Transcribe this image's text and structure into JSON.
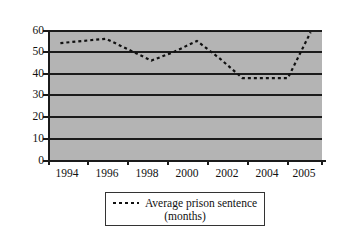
{
  "chart_data": {
    "type": "line",
    "title": "",
    "subtitle": "",
    "xlabel": "",
    "ylabel": "",
    "x": [
      1994,
      1995,
      1996,
      1997,
      1998,
      1999,
      2000,
      2001,
      2002,
      2003,
      2004,
      2005
    ],
    "categories": [
      "1994",
      "1995",
      "1996",
      "1997",
      "1998",
      "1999",
      "2000",
      "2001",
      "2002",
      "2003",
      "2004",
      "2005"
    ],
    "xtick_labels": [
      "1994",
      "1996",
      "1998",
      "2000",
      "2002",
      "2004",
      "2005"
    ],
    "ytick_labels": [
      "0",
      "10",
      "20",
      "30",
      "40",
      "50",
      "60"
    ],
    "yticks": [
      0,
      10,
      20,
      30,
      40,
      50,
      60
    ],
    "ylim": [
      0,
      60
    ],
    "xlim": [
      1993.5,
      2005.5
    ],
    "grid": "horizontal",
    "legend_position": "bottom",
    "series": [
      {
        "name": "Average prison sentence (months)",
        "line_style": "dashed",
        "color": "#111111",
        "values": [
          54,
          55,
          56,
          51,
          46,
          50,
          55,
          47,
          38,
          38,
          38,
          59
        ]
      }
    ],
    "legend_entries": [
      {
        "line_1": "Average prison sentence",
        "line_2": "(months)",
        "swatch": "dashed-line-swatch"
      }
    ],
    "plot_background_color": "#b4b4b4",
    "gridline_color": "#1b1b1b",
    "axis_color": "#1b1b1b",
    "figure_background_color": "#ffffff"
  }
}
